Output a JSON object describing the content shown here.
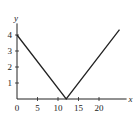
{
  "chart_data": {
    "type": "line",
    "title": "",
    "xlabel": "x",
    "ylabel": "y",
    "xlim": [
      0,
      26
    ],
    "ylim": [
      0,
      4.6
    ],
    "grid": false,
    "x_ticks": [
      0,
      5,
      10,
      15,
      20
    ],
    "x_tick_labels": [
      "0",
      "5",
      "10",
      "15",
      "20"
    ],
    "y_ticks": [
      1,
      2,
      3,
      4
    ],
    "y_tick_labels": [
      "1",
      "2",
      "3",
      "4"
    ],
    "series": [
      {
        "name": "y = |x - 12| / 3",
        "x": [
          0,
          12,
          25
        ],
        "y": [
          4,
          0,
          4.33
        ]
      }
    ],
    "colors": {
      "line": "#222222",
      "axis": "#222222"
    }
  }
}
